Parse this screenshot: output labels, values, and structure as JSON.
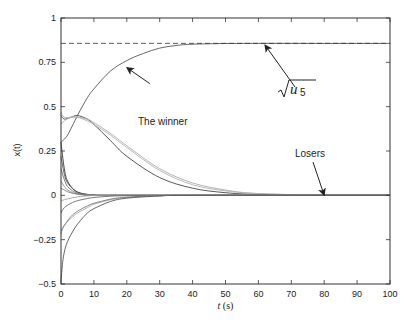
{
  "chart_data": {
    "type": "line",
    "title": "",
    "xlabel": "t (s)",
    "ylabel": "x(t)",
    "xlim": [
      0,
      100
    ],
    "ylim": [
      -0.5,
      1
    ],
    "grid": false,
    "legend": null,
    "x_ticks": [
      0,
      10,
      20,
      30,
      40,
      50,
      60,
      70,
      80,
      90,
      100
    ],
    "x_tick_labels": [
      "0",
      "10",
      "20",
      "30",
      "40",
      "50",
      "60",
      "70",
      "80",
      "90",
      "100"
    ],
    "y_ticks": [
      -0.5,
      -0.25,
      0,
      0.25,
      0.5,
      0.75,
      1
    ],
    "y_tick_labels": [
      "−0.5",
      "−0.25",
      "0",
      "0.25",
      "0.5",
      "0.75",
      "1"
    ],
    "reference_line": {
      "label": "sqrt(u5)",
      "y": 0.857,
      "style": "dashed"
    },
    "annotations": [
      {
        "text": "The winner",
        "arrow_to": [
          20,
          0.72
        ],
        "text_at": [
          33,
          0.58
        ]
      },
      {
        "text": "√u₅",
        "arrow_to": [
          62,
          0.86
        ],
        "text_at": [
          61,
          0.6
        ]
      },
      {
        "text": "Losers",
        "arrow_to": [
          80,
          0.0
        ],
        "text_at": [
          76,
          0.12
        ]
      }
    ],
    "series": [
      {
        "name": "winner",
        "color": "#555555",
        "x": [
          0,
          2,
          5,
          8,
          10,
          15,
          20,
          25,
          30,
          35,
          40,
          50,
          60,
          80,
          100
        ],
        "values": [
          0.3,
          0.34,
          0.45,
          0.55,
          0.6,
          0.7,
          0.76,
          0.8,
          0.83,
          0.845,
          0.852,
          0.856,
          0.857,
          0.857,
          0.857
        ]
      },
      {
        "name": "loser-hump-dark",
        "color": "#444444",
        "x": [
          0,
          1,
          3,
          5,
          8,
          10,
          15,
          20,
          30,
          40,
          50,
          60,
          80,
          100
        ],
        "values": [
          0.45,
          0.43,
          0.44,
          0.45,
          0.43,
          0.4,
          0.31,
          0.22,
          0.1,
          0.04,
          0.015,
          0.005,
          0.0,
          0.0
        ]
      },
      {
        "name": "loser-hump-light",
        "color": "#aaaaaa",
        "x": [
          0,
          1,
          3,
          5,
          8,
          10,
          15,
          20,
          30,
          40,
          50,
          60,
          80,
          100
        ],
        "values": [
          0.47,
          0.44,
          0.44,
          0.44,
          0.43,
          0.41,
          0.35,
          0.28,
          0.15,
          0.07,
          0.03,
          0.01,
          0.0,
          0.0
        ]
      },
      {
        "name": "loser-light-2",
        "color": "#b0b0b0",
        "x": [
          0,
          1,
          3,
          5,
          8,
          10,
          15,
          20,
          30,
          40,
          50,
          60,
          80,
          100
        ],
        "values": [
          0.4,
          0.42,
          0.44,
          0.44,
          0.42,
          0.4,
          0.34,
          0.27,
          0.14,
          0.06,
          0.025,
          0.01,
          0.0,
          0.0
        ]
      },
      {
        "name": "decay-1",
        "color": "#333333",
        "x": [
          0,
          1,
          2,
          4,
          6,
          8,
          10,
          15,
          100
        ],
        "values": [
          0.3,
          0.15,
          0.08,
          0.03,
          0.012,
          0.005,
          0.002,
          0.0,
          0.0
        ]
      },
      {
        "name": "decay-2",
        "color": "#555555",
        "x": [
          0,
          1,
          2,
          4,
          6,
          8,
          10,
          15,
          100
        ],
        "values": [
          0.22,
          0.12,
          0.07,
          0.03,
          0.012,
          0.005,
          0.002,
          0.0,
          0.0
        ]
      },
      {
        "name": "decay-3",
        "color": "#666666",
        "x": [
          0,
          1,
          2,
          4,
          6,
          8,
          10,
          15,
          100
        ],
        "values": [
          0.15,
          0.09,
          0.05,
          0.02,
          0.008,
          0.003,
          0.001,
          0.0,
          0.0
        ]
      },
      {
        "name": "decay-4",
        "color": "#888888",
        "x": [
          0,
          1,
          2,
          4,
          6,
          8,
          10,
          15,
          100
        ],
        "values": [
          0.08,
          0.05,
          0.03,
          0.012,
          0.005,
          0.002,
          0.001,
          0.0,
          0.0
        ]
      },
      {
        "name": "decay-5",
        "color": "#777777",
        "x": [
          0,
          1,
          2,
          4,
          6,
          8,
          10,
          15,
          100
        ],
        "values": [
          0.04,
          0.03,
          0.02,
          0.01,
          0.004,
          0.002,
          0.0,
          0.0,
          0.0
        ]
      },
      {
        "name": "neg-1",
        "color": "#999999",
        "x": [
          0,
          1,
          2,
          4,
          6,
          8,
          10,
          15,
          100
        ],
        "values": [
          -0.03,
          -0.025,
          -0.02,
          -0.012,
          -0.006,
          -0.003,
          -0.001,
          0.0,
          0.0
        ]
      },
      {
        "name": "neg-2",
        "color": "#666666",
        "x": [
          0,
          1,
          3,
          5,
          8,
          10,
          15,
          20,
          30,
          100
        ],
        "values": [
          -0.1,
          -0.07,
          -0.045,
          -0.03,
          -0.018,
          -0.012,
          -0.005,
          -0.002,
          0.0,
          0.0
        ]
      },
      {
        "name": "neg-3",
        "color": "#aaaaaa",
        "x": [
          0,
          1,
          3,
          5,
          8,
          10,
          15,
          20,
          30,
          40,
          100
        ],
        "values": [
          -0.22,
          -0.17,
          -0.13,
          -0.1,
          -0.07,
          -0.05,
          -0.025,
          -0.012,
          -0.003,
          0.0,
          0.0
        ]
      },
      {
        "name": "neg-4",
        "color": "#777777",
        "x": [
          0,
          1,
          3,
          5,
          8,
          10,
          15,
          20,
          30,
          40,
          100
        ],
        "values": [
          -0.2,
          -0.17,
          -0.12,
          -0.09,
          -0.06,
          -0.045,
          -0.022,
          -0.01,
          -0.002,
          0.0,
          0.0
        ]
      },
      {
        "name": "neg-5",
        "color": "#555555",
        "x": [
          0,
          0.5,
          1,
          2,
          4,
          6,
          8,
          10,
          15,
          20,
          30,
          40,
          100
        ],
        "values": [
          -0.48,
          -0.38,
          -0.32,
          -0.26,
          -0.19,
          -0.14,
          -0.1,
          -0.075,
          -0.035,
          -0.016,
          -0.004,
          0.0,
          0.0
        ]
      }
    ]
  }
}
